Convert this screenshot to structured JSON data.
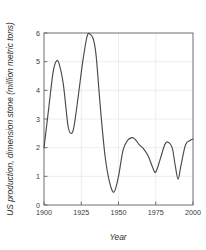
{
  "chart_data": {
    "type": "line",
    "title": "",
    "subtitle": "",
    "xlabel": "Year",
    "ylabel": "US production, dimension stone (million metric tons)",
    "xlim": [
      1900,
      2000
    ],
    "ylim": [
      0,
      6
    ],
    "xticks": [
      1900,
      1925,
      1950,
      1975,
      2000
    ],
    "xtick_labels": [
      "1900",
      "1925",
      "1950",
      "1975",
      "2000"
    ],
    "yticks": [
      0,
      1,
      2,
      3,
      4,
      5,
      6
    ],
    "ytick_labels": [
      "0",
      "1",
      "2",
      "3",
      "4",
      "5",
      "6"
    ],
    "grid": true,
    "grid_color": "#e6e6e6",
    "legend": null,
    "legend_position": "none",
    "line_color": "#4a4a4a",
    "frame_color": "#6f6f6f",
    "background_color": "#ffffff",
    "annotations": [],
    "series": [
      {
        "name": "US production, dimension stone",
        "x": [
          1900,
          1903,
          1906,
          1908,
          1910,
          1913,
          1916,
          1918,
          1920,
          1923,
          1926,
          1929,
          1931,
          1933,
          1935,
          1938,
          1941,
          1944,
          1947,
          1950,
          1953,
          1956,
          1959,
          1961,
          1964,
          1967,
          1970,
          1973,
          1975,
          1978,
          1981,
          1983,
          1986,
          1988,
          1990,
          1992,
          1995,
          1998,
          2000
        ],
        "y": [
          2.0,
          3.3,
          4.6,
          5.0,
          4.95,
          4.2,
          2.8,
          2.5,
          2.7,
          3.8,
          5.0,
          5.9,
          5.95,
          5.8,
          5.2,
          3.3,
          1.7,
          0.8,
          0.45,
          1.0,
          1.9,
          2.25,
          2.35,
          2.3,
          2.1,
          1.95,
          1.7,
          1.3,
          1.15,
          1.6,
          2.1,
          2.2,
          2.0,
          1.4,
          0.9,
          1.4,
          2.1,
          2.25,
          2.3
        ]
      }
    ]
  },
  "axis": {
    "x_title": "Year",
    "y_title": "US production, dimension stone (million metric tons)"
  }
}
